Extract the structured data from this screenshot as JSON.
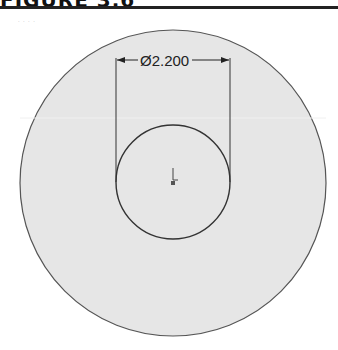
{
  "figure": {
    "title": "FIGURE 3.6",
    "stray_mark": "· · · ·"
  },
  "drawing": {
    "outer_circle": {
      "cx": 173,
      "cy": 183,
      "r": 153,
      "fill": "#e6e6e6",
      "stroke": "#555555"
    },
    "inner_circle": {
      "cx": 173,
      "cy": 182,
      "r": 57,
      "fill": "#e6e6e6",
      "stroke": "#333333"
    },
    "dimension": {
      "symbol": "Ø",
      "value": "2.200",
      "label": "Ø2.200",
      "line_y": 80,
      "left_x": 116,
      "right_x": 230
    },
    "origin_marker": {
      "x": 173,
      "y": 170
    }
  }
}
